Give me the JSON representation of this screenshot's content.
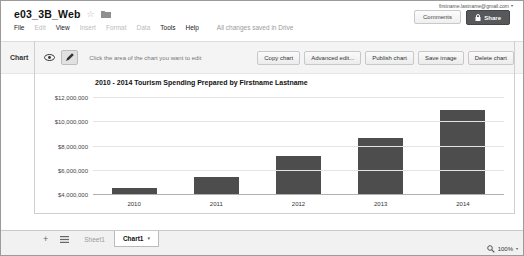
{
  "header": {
    "doc_title": "e03_3B_Web",
    "account": "firstname.lastname@gmail.com",
    "comments_label": "Comments",
    "share_label": "Share",
    "menu": [
      {
        "label": "File",
        "enabled": true
      },
      {
        "label": "Edit",
        "enabled": false
      },
      {
        "label": "View",
        "enabled": true
      },
      {
        "label": "Insert",
        "enabled": false
      },
      {
        "label": "Format",
        "enabled": false
      },
      {
        "label": "Data",
        "enabled": false
      },
      {
        "label": "Tools",
        "enabled": true
      },
      {
        "label": "Help",
        "enabled": true
      }
    ],
    "save_status": "All changes saved in Drive"
  },
  "chart_toolbar": {
    "panel_label": "Chart",
    "hint": "Click the area of the chart you want to edit",
    "buttons": [
      "Copy chart",
      "Advanced edit...",
      "Publish chart",
      "Save image",
      "Delete chart"
    ]
  },
  "chart_data": {
    "type": "bar",
    "title": "2010 - 2014 Tourism Spending Prepared by Firstname Lastname",
    "categories": [
      "2010",
      "2011",
      "2012",
      "2013",
      "2014"
    ],
    "values": [
      4600000,
      5500000,
      7200000,
      8700000,
      11000000
    ],
    "xlabel": "",
    "ylabel": "",
    "ylim": [
      4000000,
      12500000
    ],
    "y_ticks": [
      {
        "value": 4000000,
        "label": "$4,000,000"
      },
      {
        "value": 6000000,
        "label": "$6,000,000"
      },
      {
        "value": 8000000,
        "label": "$8,000,000"
      },
      {
        "value": 10000000,
        "label": "$10,000,000"
      },
      {
        "value": 12000000,
        "label": "$12,000,000"
      }
    ],
    "bar_color": "#4d4d4d",
    "grid": true,
    "legend": "none"
  },
  "sheet_bar": {
    "tabs": [
      {
        "label": "Sheet1",
        "active": false
      },
      {
        "label": "Chart1",
        "active": true
      }
    ]
  },
  "status_bar": {
    "zoom": "100%"
  },
  "icons": {
    "star": "☆",
    "caret_down": "▾",
    "plus": "+"
  },
  "colors": {
    "bar": "#4d4d4d",
    "share_button_bg": "#57585a",
    "toolbar_bg": "#f4f4f4",
    "sheet_bar_bg": "#f1f1f1"
  }
}
